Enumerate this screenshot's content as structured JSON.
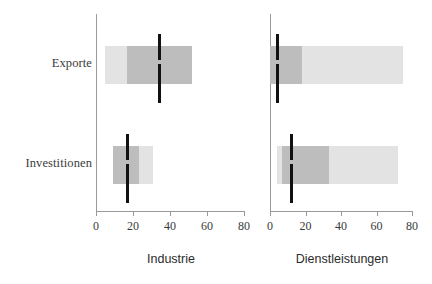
{
  "chart_data": {
    "type": "bar",
    "title": "",
    "subtitle": "",
    "xlabel": "",
    "ylabel": "",
    "xlim": [
      0,
      80
    ],
    "grid": false,
    "legend": false,
    "orientation": "horizontal",
    "categories": [
      "Exporte",
      "Investitionen"
    ],
    "xticks": [
      0,
      20,
      40,
      60,
      80
    ],
    "panels": [
      {
        "name": "industrie",
        "title": "Industrie",
        "axis_min": 0,
        "axis_max": 80,
        "tick_labels": [
          "0",
          "20",
          "40",
          "60",
          "80"
        ],
        "rows": [
          {
            "category": "Exporte",
            "outer_range": [
              5,
              52
            ],
            "inner_range": [
              17,
              52
            ],
            "marker": 34
          },
          {
            "category": "Investitionen",
            "outer_range": [
              9,
              31
            ],
            "inner_range": [
              9,
              23
            ],
            "marker": 17
          }
        ]
      },
      {
        "name": "dienstleistungen",
        "title": "Dienstleistungen",
        "axis_min": 0,
        "axis_max": 80,
        "tick_labels": [
          "0",
          "20",
          "40",
          "60",
          "80"
        ],
        "rows": [
          {
            "category": "Exporte",
            "outer_range": [
              0,
              75
            ],
            "inner_range": [
              0,
              18
            ],
            "marker": 4
          },
          {
            "category": "Investitionen",
            "outer_range": [
              4,
              72
            ],
            "inner_range": [
              7,
              33
            ],
            "marker": 12
          }
        ]
      }
    ],
    "colors": {
      "outer_bar": "#e3e3e3",
      "inner_bar": "#bdbdbd",
      "marker": "#111111",
      "axis": "#9a9a9a",
      "text": "#3a3a3a"
    }
  },
  "labels": {
    "exporte": "Exporte",
    "investitionen": "Investitionen"
  },
  "panel_titles": {
    "industrie": "Industrie",
    "dienstleistungen": "Dienstleistungen"
  },
  "ticks": {
    "t0": "0",
    "t20": "20",
    "t40": "40",
    "t60": "60",
    "t80": "80"
  }
}
